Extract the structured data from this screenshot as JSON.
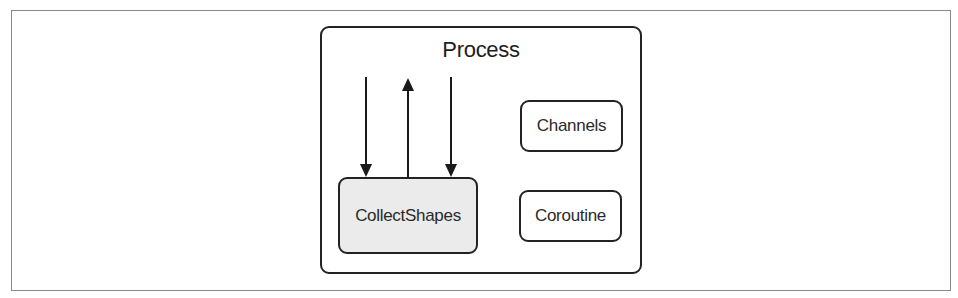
{
  "diagram": {
    "container": {
      "title": "Process"
    },
    "nodes": [
      {
        "id": "collect_shapes",
        "label": "CollectShapes",
        "fill": "#ebebeb"
      },
      {
        "id": "channels",
        "label": "Channels",
        "fill": "#ffffff"
      },
      {
        "id": "coroutine",
        "label": "Coroutine",
        "fill": "#ffffff"
      }
    ],
    "edges": [
      {
        "from": "external",
        "to": "collect_shapes",
        "direction": "down"
      },
      {
        "from": "collect_shapes",
        "to": "external",
        "direction": "up"
      },
      {
        "from": "external",
        "to": "collect_shapes",
        "direction": "down"
      }
    ],
    "colors": {
      "stroke": "#222222",
      "frame": "#8a8a8a",
      "highlight_fill": "#ebebeb"
    }
  }
}
